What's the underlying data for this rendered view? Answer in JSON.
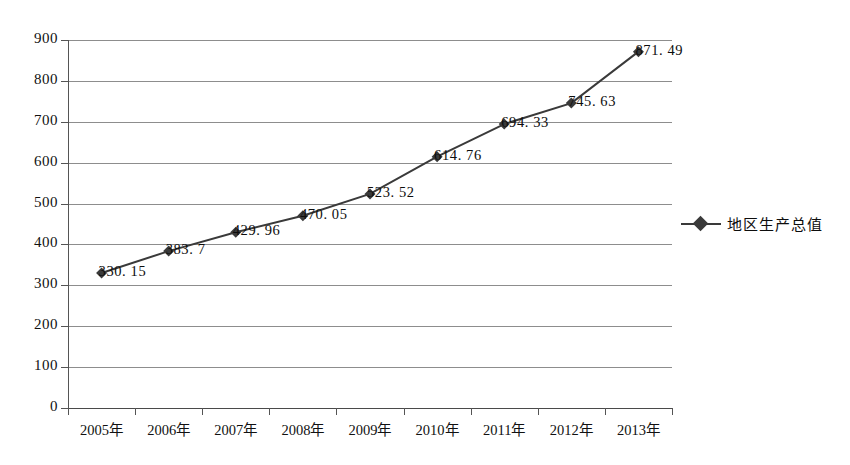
{
  "chart_data": {
    "type": "line",
    "title": "",
    "subtitle": "",
    "xlabel": "",
    "ylabel": "",
    "categories": [
      "2005年",
      "2006年",
      "2007年",
      "2008年",
      "2009年",
      "2010年",
      "2011年",
      "2012年",
      "2013年"
    ],
    "series": [
      {
        "name": "地区生产总值",
        "values": [
          330.15,
          383.7,
          429.96,
          470.05,
          523.52,
          614.76,
          694.33,
          745.63,
          871.49
        ],
        "point_labels": [
          "330. 15",
          "383. 7",
          "429. 96",
          "470. 05",
          "523. 52",
          "614. 76",
          "694. 33",
          "745. 63",
          "871. 49"
        ],
        "color": "#3a3a3a",
        "marker": "diamond"
      }
    ],
    "ylim": [
      0,
      900
    ],
    "ytick_step": 100,
    "ytick_labels": [
      "900",
      "800",
      "700",
      "600",
      "500",
      "400",
      "300",
      "200",
      "100",
      "0"
    ],
    "ytick_values": [
      900,
      800,
      700,
      600,
      500,
      400,
      300,
      200,
      100,
      0
    ],
    "grid": true,
    "grid_axis": "y",
    "legend_position": "right",
    "legend_entries": [
      "地区生产总值"
    ]
  },
  "colors": {
    "series": "#3a3a3a",
    "gridline": "#8d8d8d",
    "axis": "#555555",
    "text": "#111111",
    "background": "#ffffff"
  }
}
